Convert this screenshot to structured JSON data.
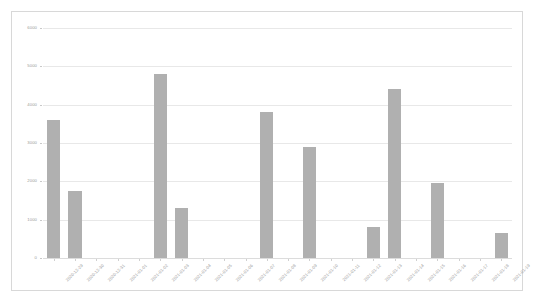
{
  "chart": {
    "background_color": "#ffffff",
    "border_color": "#d8d8d8",
    "bar_color": "#b0b0b0",
    "grid_color": "#e8e8e8",
    "tick_label_color": "#9a9a9a"
  },
  "chart_data": {
    "type": "bar",
    "title": "",
    "subtitle": "",
    "xlabel": "",
    "ylabel": "",
    "grid": true,
    "legend": false,
    "ylim": [
      0,
      6000
    ],
    "yticks": [
      0,
      1000,
      2000,
      3000,
      4000,
      5000,
      6000
    ],
    "ytick_labels": [
      "0",
      "1000",
      "2000",
      "3000",
      "4000",
      "5000",
      "6000"
    ],
    "categories": [
      "2020-12-29",
      "2020-12-30",
      "2020-12-31",
      "2021-01-01",
      "2021-01-02",
      "2021-01-03",
      "2021-01-04",
      "2021-01-05",
      "2021-01-06",
      "2021-01-07",
      "2021-01-08",
      "2021-01-09",
      "2021-01-10",
      "2021-01-11",
      "2021-01-12",
      "2021-01-13",
      "2021-01-14",
      "2021-01-15",
      "2021-01-16",
      "2021-01-17",
      "2021-01-18",
      "2021-01-19"
    ],
    "values": [
      3600,
      1750,
      0,
      0,
      0,
      4800,
      1300,
      0,
      0,
      0,
      3800,
      0,
      2900,
      0,
      0,
      800,
      4400,
      0,
      1950,
      0,
      0,
      650
    ]
  }
}
